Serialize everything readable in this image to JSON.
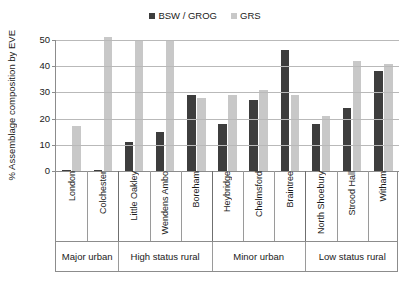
{
  "chart_data": {
    "type": "bar",
    "title": "",
    "xlabel": "",
    "ylabel": "% Assemblage composition by EVE",
    "ylim": [
      0,
      50
    ],
    "yticks": [
      0,
      10,
      20,
      30,
      40,
      50
    ],
    "grid": true,
    "legend_position": "top-center",
    "categories": [
      "London",
      "Colchester",
      "Little Oakley",
      "Wendens Ambo",
      "Boreham",
      "Heybridge",
      "Chelmsford",
      "Braintree",
      "North Shoebury",
      "Strood Hall",
      "Witham"
    ],
    "groups": [
      {
        "label": "Major urban",
        "span": 2
      },
      {
        "label": "High status rural",
        "span": 3
      },
      {
        "label": "Minor urban",
        "span": 3
      },
      {
        "label": "Low status rural",
        "span": 3
      }
    ],
    "series": [
      {
        "name": "BSW / GROG",
        "color": "#3d3d3d",
        "values": [
          0.5,
          0.5,
          11,
          15,
          29,
          18,
          27,
          46,
          18,
          24,
          38
        ]
      },
      {
        "name": "GRS",
        "color": "#c8c8c8",
        "values": [
          17,
          51,
          50,
          50,
          28,
          29,
          31,
          29,
          21,
          42,
          41
        ]
      }
    ]
  },
  "legend": {
    "items": [
      {
        "label": "BSW / GROG",
        "color": "#3d3d3d"
      },
      {
        "label": "GRS",
        "color": "#c8c8c8"
      }
    ]
  }
}
